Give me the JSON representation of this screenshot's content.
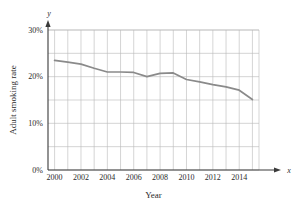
{
  "chart_data": {
    "type": "line",
    "title": "",
    "xlabel": "Year",
    "ylabel": "Adult smoking rate",
    "x_axis_name": "x",
    "y_axis_name": "y",
    "xlim": [
      1999.5,
      2015.5
    ],
    "ylim": [
      0,
      30
    ],
    "grid": true,
    "legend": "none",
    "y_ticks": [
      {
        "value": 0,
        "label": "0%"
      },
      {
        "value": 10,
        "label": "10%"
      },
      {
        "value": 20,
        "label": "20%"
      },
      {
        "value": 30,
        "label": "30%"
      }
    ],
    "y_gridlines": [
      0,
      5,
      10,
      15,
      20,
      25,
      30
    ],
    "x_ticks": [
      {
        "value": 2000,
        "label": "2000"
      },
      {
        "value": 2002,
        "label": "2002"
      },
      {
        "value": 2004,
        "label": "2004"
      },
      {
        "value": 2006,
        "label": "2006"
      },
      {
        "value": 2008,
        "label": "2008"
      },
      {
        "value": 2010,
        "label": "2010"
      },
      {
        "value": 2012,
        "label": "2012"
      },
      {
        "value": 2014,
        "label": "2014"
      }
    ],
    "x_gridlines": [
      2000,
      2001,
      2002,
      2003,
      2004,
      2005,
      2006,
      2007,
      2008,
      2009,
      2010,
      2011,
      2012,
      2013,
      2014,
      2015
    ],
    "series": [
      {
        "name": "Adult smoking rate",
        "color": "#8a8a8a",
        "x": [
          2000,
          2001,
          2002,
          2003,
          2004,
          2005,
          2006,
          2007,
          2008,
          2009,
          2010,
          2011,
          2012,
          2013,
          2014,
          2015
        ],
        "values": [
          23.5,
          23.1,
          22.7,
          21.8,
          21.0,
          21.0,
          20.9,
          20.0,
          20.7,
          20.8,
          19.4,
          18.9,
          18.3,
          17.8,
          17.1,
          15.1
        ]
      }
    ],
    "colors": {
      "line": "#8a8a8a",
      "grid": "#b9b9b9",
      "axis": "#3a3a3a",
      "text": "#2b2b2b",
      "background": "#ffffff"
    }
  }
}
